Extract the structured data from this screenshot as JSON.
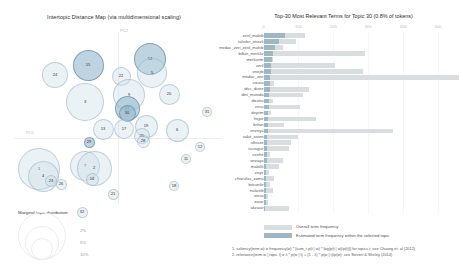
{
  "left": {
    "title": "Intertopic Distance Map (via multidimensional scaling)",
    "axis_labels": {
      "x": "PC1",
      "y": "PC2"
    },
    "marginal_legend": {
      "title": "Marginal topic distribution",
      "percents": [
        "2%",
        "5%",
        "10%"
      ]
    },
    "bubbles": [
      {
        "label": "24",
        "cx": 41,
        "cy": 49,
        "r": 13.0,
        "selected": false
      },
      {
        "label": "15",
        "cx": 74,
        "cy": 39,
        "r": 15.5,
        "selected": true
      },
      {
        "label": "3",
        "cx": 71,
        "cy": 76,
        "r": 19.0,
        "selected": false
      },
      {
        "label": "14",
        "cx": 136,
        "cy": 33,
        "r": 16.0,
        "selected": true
      },
      {
        "label": "5",
        "cx": 138,
        "cy": 47,
        "r": 15.0,
        "selected": false
      },
      {
        "label": "22",
        "cx": 107,
        "cy": 50,
        "r": 9.5,
        "selected": false
      },
      {
        "label": "9",
        "cx": 115,
        "cy": 69,
        "r": 16.0,
        "selected": false
      },
      {
        "label": "20",
        "cx": 155,
        "cy": 68,
        "r": 10.5,
        "selected": false
      },
      {
        "label": "27",
        "cx": 113,
        "cy": 82,
        "r": 12.5,
        "selected": true
      },
      {
        "label": "30",
        "cx": 113,
        "cy": 87,
        "r": 8.5,
        "selected": true
      },
      {
        "label": "13",
        "cx": 89,
        "cy": 103,
        "r": 10.5,
        "selected": false
      },
      {
        "label": "17",
        "cx": 110,
        "cy": 103,
        "r": 10.0,
        "selected": false
      },
      {
        "label": "19",
        "cx": 132,
        "cy": 100,
        "r": 11.5,
        "selected": false
      },
      {
        "label": "25",
        "cx": 128,
        "cy": 110,
        "r": 8.0,
        "selected": false
      },
      {
        "label": "28",
        "cx": 129,
        "cy": 115,
        "r": 6.5,
        "selected": false
      },
      {
        "label": "6",
        "cx": 163,
        "cy": 104,
        "r": 11.5,
        "selected": false
      },
      {
        "label": "29",
        "cx": 75,
        "cy": 116,
        "r": 5.5,
        "selected": true
      },
      {
        "label": "1",
        "cx": 25,
        "cy": 143,
        "r": 21.0,
        "selected": false
      },
      {
        "label": "4",
        "cx": 29,
        "cy": 150,
        "r": 15.5,
        "selected": false
      },
      {
        "label": "7",
        "cx": 71,
        "cy": 140,
        "r": 15.0,
        "selected": false
      },
      {
        "label": "2",
        "cx": 80,
        "cy": 142,
        "r": 17.5,
        "selected": false
      },
      {
        "label": "23",
        "cx": 37,
        "cy": 155,
        "r": 6.0,
        "selected": false
      },
      {
        "label": "26",
        "cx": 47,
        "cy": 158,
        "r": 5.5,
        "selected": false
      },
      {
        "label": "16",
        "cx": 78,
        "cy": 153,
        "r": 6.5,
        "selected": false
      },
      {
        "label": "21",
        "cx": 99,
        "cy": 168,
        "r": 5.5,
        "selected": false
      },
      {
        "label": "32",
        "cx": 68,
        "cy": 186,
        "r": 5.5,
        "selected": false
      },
      {
        "label": "18",
        "cx": 160,
        "cy": 160,
        "r": 5.0,
        "selected": false
      },
      {
        "label": "11",
        "cx": 172,
        "cy": 133,
        "r": 5.0,
        "selected": false
      },
      {
        "label": "12",
        "cx": 186,
        "cy": 121,
        "r": 5.0,
        "selected": false
      },
      {
        "label": "31",
        "cx": 193,
        "cy": 86,
        "r": 5.0,
        "selected": false
      }
    ]
  },
  "right": {
    "title": "Top-30 Most Relevant Terms for Topic 30 (0.8% of tokens)",
    "x_ticks": [
      "0",
      "100",
      "200",
      "300",
      "400",
      "500"
    ],
    "x_max": 560,
    "legend": {
      "overall_label": "Overall term frequency",
      "estimated_label": "Estimated term frequency within the selected topic"
    },
    "formulas": [
      "1. saliency(term w) = frequency(w) * [sum_t p(t | w) * log(p(t | w)/p(t))] for topics t; see Chuang et. al (2012)",
      "2. relevance(term w | topic t) = λ * p(w | t) + (1 - λ) * p(w | t)/p(w); see Sievert & Shirley (2014)"
    ],
    "terms": [
      {
        "term": "zeril_mahib",
        "overall": 118,
        "estimated": 62
      },
      {
        "term": "tahriler_enezli",
        "overall": 92,
        "estimated": 43
      },
      {
        "term": "medac_zeri_zeril_mahib",
        "overall": 57,
        "estimated": 34
      },
      {
        "term": "bilkar_merkliz",
        "overall": 290,
        "estimated": 26
      },
      {
        "term": "merkurim",
        "overall": 28,
        "estimated": 24
      },
      {
        "term": "zeril",
        "overall": 205,
        "estimated": 22
      },
      {
        "term": "enejib",
        "overall": 285,
        "estimated": 21
      },
      {
        "term": "medac_zeri",
        "overall": 560,
        "estimated": 20
      },
      {
        "term": "vizura",
        "overall": 30,
        "estimated": 19
      },
      {
        "term": "idvc_dizire",
        "overall": 130,
        "estimated": 18
      },
      {
        "term": "dini_munida",
        "overall": 112,
        "estimated": 17
      },
      {
        "term": "diezira",
        "overall": 26,
        "estimated": 16
      },
      {
        "term": "virsu",
        "overall": 105,
        "estimated": 15
      },
      {
        "term": "deyrim",
        "overall": 22,
        "estimated": 14
      },
      {
        "term": "hiçpir",
        "overall": 150,
        "estimated": 13
      },
      {
        "term": "britan",
        "overall": 60,
        "estimated": 12
      },
      {
        "term": "enzeya",
        "overall": 370,
        "estimated": 12
      },
      {
        "term": "vakit_zaten",
        "overall": 98,
        "estimated": 11
      },
      {
        "term": "ulhisze",
        "overall": 78,
        "estimated": 11
      },
      {
        "term": "iscragce",
        "overall": 72,
        "estimated": 10
      },
      {
        "term": "sirehe",
        "overall": 20,
        "estimated": 9
      },
      {
        "term": "onzaya",
        "overall": 56,
        "estimated": 9
      },
      {
        "term": "malollit",
        "overall": 44,
        "estimated": 8
      },
      {
        "term": "zeyir",
        "overall": 16,
        "estimated": 8
      },
      {
        "term": "chiurulas_zoma",
        "overall": 30,
        "estimated": 7
      },
      {
        "term": "bitcunile",
        "overall": 19,
        "estimated": 7
      },
      {
        "term": "nulareb",
        "overall": 26,
        "estimated": 6
      },
      {
        "term": "zieva",
        "overall": 14,
        "estimated": 6
      },
      {
        "term": "zarar",
        "overall": 12,
        "estimated": 6
      },
      {
        "term": "akzasir",
        "overall": 74,
        "estimated": 5
      }
    ]
  }
}
